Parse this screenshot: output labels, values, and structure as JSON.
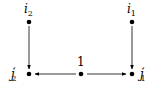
{
  "diagram": {
    "nodes": [
      {
        "id": "i2",
        "label": "i",
        "sub": "2",
        "prime": "",
        "x": 29,
        "y": 22,
        "lx": 24,
        "ly": 13
      },
      {
        "id": "i1",
        "label": "i",
        "sub": "1",
        "prime": "",
        "x": 132,
        "y": 22,
        "lx": 127,
        "ly": 13
      },
      {
        "id": "j2p",
        "label": "j",
        "sub": "2",
        "prime": "′",
        "x": 29,
        "y": 74,
        "lx": 9,
        "ly": 79
      },
      {
        "id": "n1",
        "label": "1",
        "sub": "",
        "prime": "",
        "x": 81,
        "y": 74,
        "lx": 77,
        "ly": 66
      },
      {
        "id": "j1p",
        "label": "j",
        "sub": "1",
        "prime": "′",
        "x": 132,
        "y": 74,
        "lx": 139,
        "ly": 79
      }
    ],
    "edges": [
      {
        "from": "i2",
        "to": "j2p"
      },
      {
        "from": "i1",
        "to": "j1p"
      },
      {
        "from": "n1",
        "to": "j2p"
      },
      {
        "from": "n1",
        "to": "j1p"
      }
    ],
    "colors": {
      "stroke": "#000000",
      "node": "#000000",
      "background": "#ffffff"
    }
  }
}
